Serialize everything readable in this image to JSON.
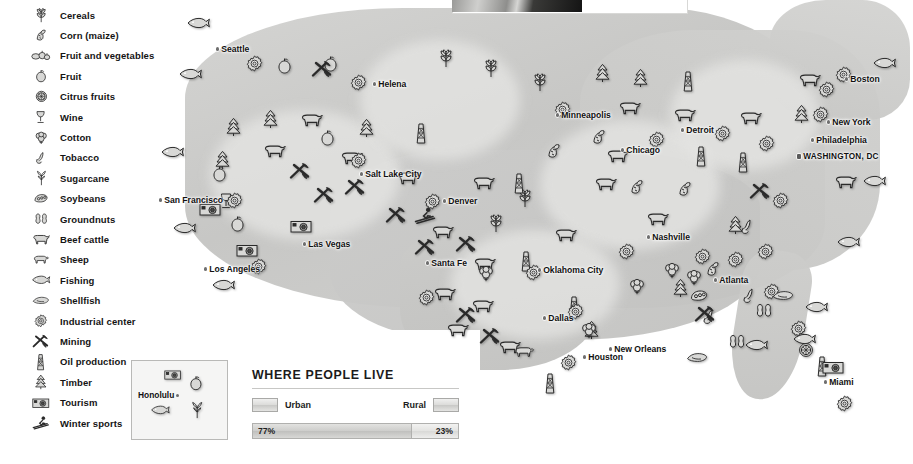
{
  "legend": {
    "items": [
      {
        "icon": "cereals-icon",
        "label": "Cereals"
      },
      {
        "icon": "corn-maize-icon",
        "label": "Corn (maize)"
      },
      {
        "icon": "fruit-and-vegetables-icon",
        "label": "Fruit and vegetables"
      },
      {
        "icon": "fruit-icon",
        "label": "Fruit"
      },
      {
        "icon": "citrus-fruits-icon",
        "label": "Citrus fruits"
      },
      {
        "icon": "wine-icon",
        "label": "Wine"
      },
      {
        "icon": "cotton-icon",
        "label": "Cotton"
      },
      {
        "icon": "tobacco-icon",
        "label": "Tobacco"
      },
      {
        "icon": "sugarcane-icon",
        "label": "Sugarcane"
      },
      {
        "icon": "soybeans-icon",
        "label": "Soybeans"
      },
      {
        "icon": "groundnuts-icon",
        "label": "Groundnuts"
      },
      {
        "icon": "beef-cattle-icon",
        "label": "Beef cattle"
      },
      {
        "icon": "sheep-icon",
        "label": "Sheep"
      },
      {
        "icon": "fishing-icon",
        "label": "Fishing"
      },
      {
        "icon": "shellfish-icon",
        "label": "Shellfish"
      },
      {
        "icon": "industrial-center-icon",
        "label": "Industrial center"
      },
      {
        "icon": "mining-icon",
        "label": "Mining"
      },
      {
        "icon": "oil-production-icon",
        "label": "Oil production"
      },
      {
        "icon": "timber-icon",
        "label": "Timber"
      },
      {
        "icon": "tourism-icon",
        "label": "Tourism"
      },
      {
        "icon": "winter-sports-icon",
        "label": "Winter sports"
      }
    ]
  },
  "cities": [
    {
      "name": "Seattle",
      "x": 216,
      "y": 44,
      "side": "left",
      "type": "city"
    },
    {
      "name": "Helena",
      "x": 373,
      "y": 79,
      "side": "right",
      "type": "city"
    },
    {
      "name": "Salt Lake City",
      "x": 360,
      "y": 169,
      "side": "left",
      "type": "city"
    },
    {
      "name": "San Francisco",
      "x": 159,
      "y": 195,
      "side": "right",
      "type": "city"
    },
    {
      "name": "Las Vegas",
      "x": 303,
      "y": 239,
      "side": "left",
      "type": "city"
    },
    {
      "name": "Los Angeles",
      "x": 204,
      "y": 264,
      "side": "right",
      "type": "city"
    },
    {
      "name": "Denver",
      "x": 443,
      "y": 196,
      "side": "left",
      "type": "city"
    },
    {
      "name": "Santa Fe",
      "x": 426,
      "y": 258,
      "side": "left",
      "type": "city"
    },
    {
      "name": "Minneapolis",
      "x": 556,
      "y": 110,
      "side": "left",
      "type": "city"
    },
    {
      "name": "Chicago",
      "x": 621,
      "y": 145,
      "side": "right",
      "type": "city"
    },
    {
      "name": "Detroit",
      "x": 681,
      "y": 125,
      "side": "right",
      "type": "city"
    },
    {
      "name": "Oklahoma City",
      "x": 538,
      "y": 265,
      "side": "left",
      "type": "city"
    },
    {
      "name": "Dallas",
      "x": 543,
      "y": 313,
      "side": "right",
      "type": "city"
    },
    {
      "name": "Houston",
      "x": 583,
      "y": 352,
      "side": "left",
      "type": "city"
    },
    {
      "name": "New Orleans",
      "x": 609,
      "y": 344,
      "side": "right",
      "type": "city"
    },
    {
      "name": "Nashville",
      "x": 647,
      "y": 232,
      "side": "right",
      "type": "city"
    },
    {
      "name": "Atlanta",
      "x": 714,
      "y": 275,
      "side": "right",
      "type": "city"
    },
    {
      "name": "Miami",
      "x": 824,
      "y": 377,
      "side": "left",
      "type": "city"
    },
    {
      "name": "Boston",
      "x": 845,
      "y": 74,
      "side": "left",
      "type": "city"
    },
    {
      "name": "New York",
      "x": 827,
      "y": 117,
      "side": "left",
      "type": "city"
    },
    {
      "name": "Philadelphia",
      "x": 811,
      "y": 135,
      "side": "left",
      "type": "city"
    },
    {
      "name": "WASHINGTON, DC",
      "x": 797,
      "y": 152,
      "side": "left",
      "type": "capital"
    }
  ],
  "inset": {
    "name": "honolulu-inset",
    "label": "Honolulu",
    "icons": [
      "tourism-icon",
      "fruit-icon",
      "fishing-icon",
      "sugarcane-icon"
    ]
  },
  "where_people_live": {
    "heading": "WHERE PEOPLE LIVE",
    "urban_label": "Urban",
    "rural_label": "Rural",
    "urban_value": "77%",
    "rural_value": "23%",
    "urban_pct": 77,
    "rural_pct": 23
  },
  "colors": {
    "land": "#c9c9c7",
    "land_pale": "#e6e6e4",
    "ocean": "#ffffff",
    "icon_fill": "#d8d8d6",
    "icon_stroke": "#2a2a2a",
    "text": "#141414"
  },
  "map_icons": [
    {
      "icon": "fishing-icon",
      "x": 186,
      "y": 17
    },
    {
      "icon": "fishing-icon",
      "x": 178,
      "y": 68
    },
    {
      "icon": "fishing-icon",
      "x": 160,
      "y": 146
    },
    {
      "icon": "fishing-icon",
      "x": 172,
      "y": 222
    },
    {
      "icon": "fishing-icon",
      "x": 211,
      "y": 279
    },
    {
      "icon": "industrial-center-icon",
      "x": 246,
      "y": 55
    },
    {
      "icon": "fruit-icon",
      "x": 277,
      "y": 57
    },
    {
      "icon": "fruit-icon",
      "x": 323,
      "y": 55
    },
    {
      "icon": "mining-icon",
      "x": 311,
      "y": 60
    },
    {
      "icon": "cereals-icon",
      "x": 437,
      "y": 48
    },
    {
      "icon": "cereals-icon",
      "x": 482,
      "y": 58
    },
    {
      "icon": "cereals-icon",
      "x": 531,
      "y": 72
    },
    {
      "icon": "industrial-center-icon",
      "x": 350,
      "y": 74
    },
    {
      "icon": "timber-icon",
      "x": 225,
      "y": 117
    },
    {
      "icon": "timber-icon",
      "x": 262,
      "y": 109
    },
    {
      "icon": "timber-icon",
      "x": 214,
      "y": 150
    },
    {
      "icon": "timber-icon",
      "x": 358,
      "y": 118
    },
    {
      "icon": "beef-cattle-icon",
      "x": 299,
      "y": 112
    },
    {
      "icon": "beef-cattle-icon",
      "x": 262,
      "y": 143
    },
    {
      "icon": "fruit-icon",
      "x": 320,
      "y": 129
    },
    {
      "icon": "fruit-icon",
      "x": 212,
      "y": 165
    },
    {
      "icon": "wine-icon",
      "x": 219,
      "y": 192
    },
    {
      "icon": "mining-icon",
      "x": 289,
      "y": 162
    },
    {
      "icon": "mining-icon",
      "x": 344,
      "y": 178
    },
    {
      "icon": "beef-cattle-icon",
      "x": 339,
      "y": 150
    },
    {
      "icon": "beef-cattle-icon",
      "x": 395,
      "y": 170
    },
    {
      "icon": "industrial-center-icon",
      "x": 350,
      "y": 152
    },
    {
      "icon": "industrial-center-icon",
      "x": 226,
      "y": 192
    },
    {
      "icon": "tourism-icon",
      "x": 199,
      "y": 202
    },
    {
      "icon": "fruit-icon",
      "x": 230,
      "y": 215
    },
    {
      "icon": "tourism-icon",
      "x": 236,
      "y": 243
    },
    {
      "icon": "tourism-icon",
      "x": 290,
      "y": 219
    },
    {
      "icon": "industrial-center-icon",
      "x": 250,
      "y": 258
    },
    {
      "icon": "mining-icon",
      "x": 313,
      "y": 186
    },
    {
      "icon": "mining-icon",
      "x": 385,
      "y": 206
    },
    {
      "icon": "mining-icon",
      "x": 414,
      "y": 238
    },
    {
      "icon": "mining-icon",
      "x": 455,
      "y": 235
    },
    {
      "icon": "winter-sports-icon",
      "x": 414,
      "y": 207
    },
    {
      "icon": "industrial-center-icon",
      "x": 424,
      "y": 193
    },
    {
      "icon": "cereals-icon",
      "x": 487,
      "y": 213
    },
    {
      "icon": "cereals-icon",
      "x": 516,
      "y": 188
    },
    {
      "icon": "beef-cattle-icon",
      "x": 471,
      "y": 175
    },
    {
      "icon": "beef-cattle-icon",
      "x": 430,
      "y": 224
    },
    {
      "icon": "beef-cattle-icon",
      "x": 553,
      "y": 227
    },
    {
      "icon": "beef-cattle-icon",
      "x": 593,
      "y": 176
    },
    {
      "icon": "oil-production-icon",
      "x": 414,
      "y": 122
    },
    {
      "icon": "oil-production-icon",
      "x": 512,
      "y": 172
    },
    {
      "icon": "oil-production-icon",
      "x": 519,
      "y": 250
    },
    {
      "icon": "oil-production-icon",
      "x": 567,
      "y": 295
    },
    {
      "icon": "oil-production-icon",
      "x": 681,
      "y": 70
    },
    {
      "icon": "oil-production-icon",
      "x": 694,
      "y": 145
    },
    {
      "icon": "oil-production-icon",
      "x": 736,
      "y": 151
    },
    {
      "icon": "oil-production-icon",
      "x": 543,
      "y": 372
    },
    {
      "icon": "oil-production-icon",
      "x": 815,
      "y": 355
    },
    {
      "icon": "beef-cattle-icon",
      "x": 472,
      "y": 256
    },
    {
      "icon": "beef-cattle-icon",
      "x": 432,
      "y": 286
    },
    {
      "icon": "beef-cattle-icon",
      "x": 470,
      "y": 298
    },
    {
      "icon": "beef-cattle-icon",
      "x": 445,
      "y": 322
    },
    {
      "icon": "beef-cattle-icon",
      "x": 497,
      "y": 339
    },
    {
      "icon": "sheep-icon",
      "x": 513,
      "y": 345
    },
    {
      "icon": "beef-cattle-icon",
      "x": 617,
      "y": 100
    },
    {
      "icon": "beef-cattle-icon",
      "x": 672,
      "y": 107
    },
    {
      "icon": "beef-cattle-icon",
      "x": 738,
      "y": 110
    },
    {
      "icon": "beef-cattle-icon",
      "x": 797,
      "y": 72
    },
    {
      "icon": "beef-cattle-icon",
      "x": 833,
      "y": 174
    },
    {
      "icon": "beef-cattle-icon",
      "x": 605,
      "y": 148
    },
    {
      "icon": "beef-cattle-icon",
      "x": 645,
      "y": 211
    },
    {
      "icon": "industrial-center-icon",
      "x": 554,
      "y": 101
    },
    {
      "icon": "industrial-center-icon",
      "x": 648,
      "y": 131
    },
    {
      "icon": "industrial-center-icon",
      "x": 714,
      "y": 125
    },
    {
      "icon": "industrial-center-icon",
      "x": 758,
      "y": 135
    },
    {
      "icon": "industrial-center-icon",
      "x": 818,
      "y": 81
    },
    {
      "icon": "industrial-center-icon",
      "x": 812,
      "y": 106
    },
    {
      "icon": "industrial-center-icon",
      "x": 835,
      "y": 66
    },
    {
      "icon": "industrial-center-icon",
      "x": 772,
      "y": 192
    },
    {
      "icon": "industrial-center-icon",
      "x": 694,
      "y": 248
    },
    {
      "icon": "industrial-center-icon",
      "x": 727,
      "y": 251
    },
    {
      "icon": "industrial-center-icon",
      "x": 757,
      "y": 243
    },
    {
      "icon": "industrial-center-icon",
      "x": 763,
      "y": 283
    },
    {
      "icon": "industrial-center-icon",
      "x": 790,
      "y": 320
    },
    {
      "icon": "industrial-center-icon",
      "x": 836,
      "y": 395
    },
    {
      "icon": "industrial-center-icon",
      "x": 618,
      "y": 243
    },
    {
      "icon": "industrial-center-icon",
      "x": 567,
      "y": 303
    },
    {
      "icon": "industrial-center-icon",
      "x": 525,
      "y": 264
    },
    {
      "icon": "industrial-center-icon",
      "x": 560,
      "y": 354
    },
    {
      "icon": "industrial-center-icon",
      "x": 418,
      "y": 289
    },
    {
      "icon": "timber-icon",
      "x": 594,
      "y": 63
    },
    {
      "icon": "timber-icon",
      "x": 632,
      "y": 68
    },
    {
      "icon": "timber-icon",
      "x": 793,
      "y": 104
    },
    {
      "icon": "timber-icon",
      "x": 727,
      "y": 215
    },
    {
      "icon": "timber-icon",
      "x": 672,
      "y": 278
    },
    {
      "icon": "timber-icon",
      "x": 583,
      "y": 320
    },
    {
      "icon": "corn-maize-icon",
      "x": 545,
      "y": 142
    },
    {
      "icon": "corn-maize-icon",
      "x": 590,
      "y": 128
    },
    {
      "icon": "corn-maize-icon",
      "x": 628,
      "y": 178
    },
    {
      "icon": "corn-maize-icon",
      "x": 676,
      "y": 180
    },
    {
      "icon": "corn-maize-icon",
      "x": 704,
      "y": 260
    },
    {
      "icon": "cotton-icon",
      "x": 477,
      "y": 265
    },
    {
      "icon": "cotton-icon",
      "x": 580,
      "y": 322
    },
    {
      "icon": "cotton-icon",
      "x": 628,
      "y": 278
    },
    {
      "icon": "cotton-icon",
      "x": 663,
      "y": 262
    },
    {
      "icon": "cotton-icon",
      "x": 685,
      "y": 269
    },
    {
      "icon": "tobacco-icon",
      "x": 740,
      "y": 218
    },
    {
      "icon": "tobacco-icon",
      "x": 742,
      "y": 287
    },
    {
      "icon": "tobacco-icon",
      "x": 702,
      "y": 308
    },
    {
      "icon": "soybeans-icon",
      "x": 689,
      "y": 289
    },
    {
      "icon": "groundnuts-icon",
      "x": 755,
      "y": 302
    },
    {
      "icon": "groundnuts-icon",
      "x": 728,
      "y": 333
    },
    {
      "icon": "shellfish-icon",
      "x": 686,
      "y": 352
    },
    {
      "icon": "shellfish-icon",
      "x": 772,
      "y": 290
    },
    {
      "icon": "fishing-icon",
      "x": 872,
      "y": 57
    },
    {
      "icon": "fishing-icon",
      "x": 862,
      "y": 175
    },
    {
      "icon": "fishing-icon",
      "x": 836,
      "y": 236
    },
    {
      "icon": "fishing-icon",
      "x": 804,
      "y": 301
    },
    {
      "icon": "fishing-icon",
      "x": 744,
      "y": 339
    },
    {
      "icon": "fishing-icon",
      "x": 792,
      "y": 333
    },
    {
      "icon": "citrus-fruits-icon",
      "x": 798,
      "y": 342
    },
    {
      "icon": "tourism-icon",
      "x": 822,
      "y": 360
    },
    {
      "icon": "mining-icon",
      "x": 749,
      "y": 182
    },
    {
      "icon": "mining-icon",
      "x": 694,
      "y": 305
    },
    {
      "icon": "mining-icon",
      "x": 479,
      "y": 327
    },
    {
      "icon": "mining-icon",
      "x": 455,
      "y": 306
    }
  ]
}
